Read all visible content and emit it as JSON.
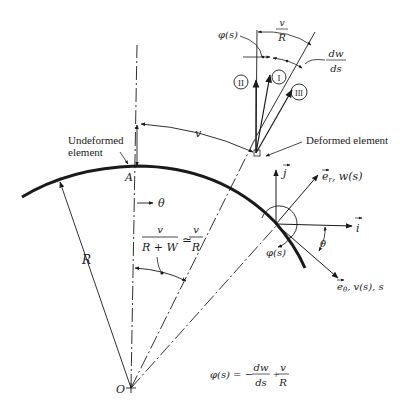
{
  "figure": {
    "labels": {
      "undeformed_element": [
        "Undeformed",
        "element"
      ],
      "deformed_element": "Deformed element",
      "point_A": "A",
      "center_O": "O",
      "radius_R": "R",
      "theta_top": "θ",
      "theta_bottom": "θ",
      "v_arc": "v",
      "phi_top": "φ(s)",
      "phi_bottom": "φ(s)",
      "v_over_R_top_num": "v",
      "v_over_R_top_den": "R",
      "dw_num": "dw",
      "dw_den": "ds",
      "circle_I": "I",
      "circle_II": "II",
      "circle_III": "III",
      "j_vec": "j",
      "i_vec": "i",
      "er_label": "e",
      "er_sub": "r",
      "er_rest": ", w(s)",
      "etheta_label": "e",
      "etheta_sub": "θ",
      "etheta_rest": ", v(s), s",
      "angle_frac_num": "v",
      "angle_frac_den": "R + W",
      "approx": "≃",
      "angle_frac2_num": "v",
      "angle_frac2_den": "R",
      "equation_lhs": "φ(s) = −",
      "equation_frac1_num": "dw",
      "equation_frac1_den": "ds",
      "equation_plus": "+",
      "equation_frac2_num": "v",
      "equation_frac2_den": "R"
    },
    "colors": {
      "ink": "#1a1a1a",
      "background": "#ffffff"
    }
  }
}
